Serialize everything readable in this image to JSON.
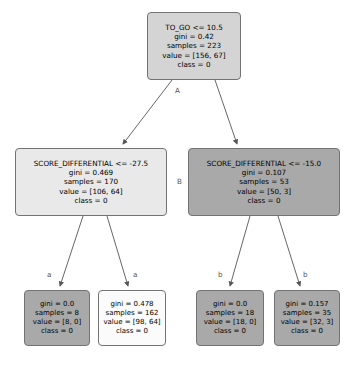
{
  "diagram": {
    "type": "decision-tree",
    "criterion": "gini",
    "colors": {
      "border": "#737373",
      "text": "#000000",
      "edge": "#555555",
      "fill_pure": "#a9a9a9",
      "fill_impure": "#fbfbfb",
      "background": "#ffffff"
    },
    "nodes": [
      {
        "id": "root",
        "role": "internal",
        "condition": "TO_GO <= 10.5",
        "gini": "gini = 0.42",
        "samples": "samples = 223",
        "value": "value = [156, 67]",
        "class": "class = 0",
        "fill": "#d4d4d4",
        "x": 147,
        "y": 12,
        "w": 94,
        "h": 68
      },
      {
        "id": "left",
        "role": "internal",
        "condition": "SCORE_DIFFERENTIAL <= -27.5",
        "gini": "gini = 0.469",
        "samples": "samples = 170",
        "value": "value = [106, 64]",
        "class": "class = 0",
        "fill": "#e9e9e9",
        "x": 15,
        "y": 148,
        "w": 152,
        "h": 68
      },
      {
        "id": "right",
        "role": "internal",
        "condition": "SCORE_DIFFERENTIAL <= -15.0",
        "gini": "gini = 0.107",
        "samples": "samples = 53",
        "value": "value = [50, 3]",
        "class": "class = 0",
        "fill": "#a9a9a9",
        "x": 188,
        "y": 148,
        "w": 152,
        "h": 68
      },
      {
        "id": "leaf1",
        "role": "leaf",
        "condition": "",
        "gini": "gini = 0.0",
        "samples": "samples = 8",
        "value": "value = [8, 0]",
        "class": "class = 0",
        "fill": "#a9a9a9",
        "x": 24,
        "y": 290,
        "w": 66,
        "h": 56
      },
      {
        "id": "leaf2",
        "role": "leaf",
        "condition": "",
        "gini": "gini = 0.478",
        "samples": "samples = 162",
        "value": "value = [98, 64]",
        "class": "class = 0",
        "fill": "#fbfbfb",
        "x": 98,
        "y": 290,
        "w": 68,
        "h": 56
      },
      {
        "id": "leaf3",
        "role": "leaf",
        "condition": "",
        "gini": "gini = 0.0",
        "samples": "samples = 18",
        "value": "value = [18, 0]",
        "class": "class = 0",
        "fill": "#a9a9a9",
        "x": 196,
        "y": 290,
        "w": 68,
        "h": 56
      },
      {
        "id": "leaf4",
        "role": "leaf",
        "condition": "",
        "gini": "gini = 0.157",
        "samples": "samples = 35",
        "value": "value = [32, 3]",
        "class": "class = 0",
        "fill": "#a9a9a9",
        "x": 274,
        "y": 290,
        "w": 66,
        "h": 56
      }
    ],
    "edge_labels": [
      {
        "id": "root-split",
        "text": "A",
        "x": 175,
        "y": 86
      },
      {
        "id": "left-branch-a",
        "text": "a",
        "x": 47,
        "y": 270
      },
      {
        "id": "right-branch-a",
        "text": "a",
        "x": 133,
        "y": 270
      },
      {
        "id": "mid-split",
        "text": "B",
        "x": 177,
        "y": 177
      },
      {
        "id": "left-branch-b",
        "text": "b",
        "x": 218,
        "y": 270
      },
      {
        "id": "right-branch-b",
        "text": "b",
        "x": 303,
        "y": 270
      }
    ]
  }
}
